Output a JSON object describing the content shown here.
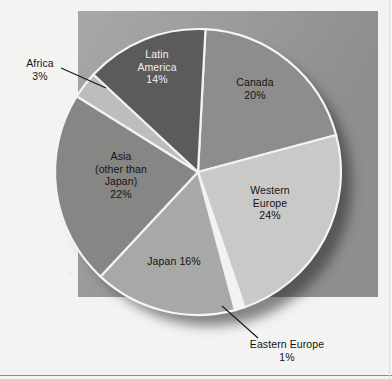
{
  "figure": {
    "background_color": "#f3f3f1",
    "panel_color": "#9e9e9e"
  },
  "chart_data": {
    "type": "pie",
    "title": "",
    "subtitle": "",
    "xlabel": "",
    "ylabel": "",
    "legend": "none",
    "grid": false,
    "units": "percent",
    "total": 100,
    "categories": [
      "Canada",
      "Western Europe",
      "Eastern Europe",
      "Japan",
      "Asia (other than Japan)",
      "Africa",
      "Latin America"
    ],
    "values": [
      20,
      24,
      1,
      16,
      22,
      3,
      14
    ],
    "colors": [
      "#8d8d8d",
      "#c9c9c7",
      "#f2f2f0",
      "#a8a8a6",
      "#868684",
      "#bdbdbb",
      "#5b5b5b"
    ],
    "slices": [
      {
        "name": "Canada",
        "value": 20,
        "label_lines": [
          "Canada",
          "20%"
        ],
        "label_text": "Canada\n20%",
        "color": "#8d8d8d",
        "label_placement": "inside",
        "label_color": "dark-on-gray",
        "start_angle_deg": 3,
        "end_angle_deg": 75
      },
      {
        "name": "Western Europe",
        "value": 24,
        "label_lines": [
          "Western",
          "Europe",
          "24%"
        ],
        "label_text": "Western\nEurope\n24%",
        "color": "#c9c9c7",
        "label_placement": "inside",
        "label_color": "dark-on-gray",
        "start_angle_deg": 75,
        "end_angle_deg": 161
      },
      {
        "name": "Eastern Europe",
        "value": 1,
        "label_lines": [
          "Eastern Europe",
          "1%"
        ],
        "label_text": "Eastern Europe\n1%",
        "color": "#f2f2f0",
        "label_placement": "outside-leader",
        "leader": "up-left",
        "start_angle_deg": 161,
        "end_angle_deg": 165
      },
      {
        "name": "Japan",
        "value": 16,
        "label_lines": [
          "Japan 16%"
        ],
        "label_text": "Japan 16%",
        "color": "#a8a8a6",
        "label_placement": "inside",
        "label_color": "dark-on-gray",
        "start_angle_deg": 165,
        "end_angle_deg": 223
      },
      {
        "name": "Asia (other than Japan)",
        "value": 22,
        "label_lines": [
          "Asia",
          "(other than",
          "Japan)",
          "22%"
        ],
        "label_text": "Asia\n(other than\nJapan)\n22%",
        "color": "#868684",
        "label_placement": "inside",
        "label_color": "dark-on-gray",
        "start_angle_deg": 223,
        "end_angle_deg": 302
      },
      {
        "name": "Africa",
        "value": 3,
        "label_lines": [
          "Africa",
          "3%"
        ],
        "label_text": "Africa\n3%",
        "color": "#bdbdbb",
        "label_placement": "outside-leader",
        "leader": "right-down",
        "start_angle_deg": 302,
        "end_angle_deg": 313
      },
      {
        "name": "Latin America",
        "value": 14,
        "label_lines": [
          "Latin",
          "America",
          "14%"
        ],
        "label_text": "Latin\nAmerica\n14%",
        "color": "#5b5b5b",
        "label_placement": "inside",
        "label_color": "light-on-dark",
        "start_angle_deg": 313,
        "end_angle_deg": 363
      }
    ]
  },
  "labels": {
    "canada": "Canada\n20%",
    "western_europe": "Western\nEurope\n24%",
    "eastern_europe": "Eastern Europe\n1%",
    "japan": "Japan 16%",
    "asia": "Asia\n(other than\nJapan)\n22%",
    "africa": "Africa\n3%",
    "latin_america": "Latin\nAmerica\n14%"
  }
}
